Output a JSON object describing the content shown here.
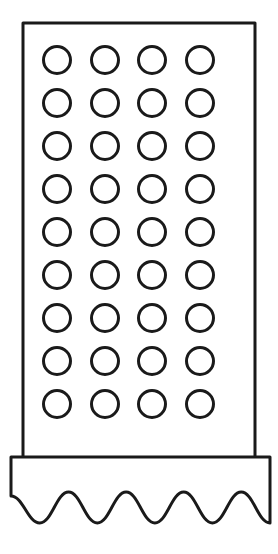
{
  "canvas": {
    "width": 278,
    "height": 554,
    "background_color": "#ffffff",
    "stroke_color": "#1a1a1a"
  },
  "figure": {
    "name": "box-grater-line-drawing",
    "style": "line-art",
    "fill_color": "#ffffff"
  },
  "body_panel": {
    "name": "perforated-body-panel",
    "x": 23,
    "y": 23,
    "width": 232,
    "height": 437,
    "stroke_width": 3,
    "fill_color": "#ffffff",
    "stroke_color": "#1a1a1a"
  },
  "hole_grid": {
    "name": "hole-grid",
    "columns": 4,
    "rows": 9,
    "total_holes": 36,
    "radius": 13.5,
    "stroke_width": 3,
    "column_centers_x": [
      57,
      105,
      152,
      200
    ],
    "row_centers_y": [
      60,
      103,
      146,
      189,
      232,
      275,
      318,
      361,
      404
    ],
    "fill_color": "#ffffff",
    "stroke_color": "#1a1a1a"
  },
  "base": {
    "name": "wavy-base",
    "x": 11,
    "y": 457,
    "width": 259,
    "top_edge_y": 457,
    "straight_side_bottom_y": 496,
    "wave": {
      "name": "wave-edge",
      "bumps": 4,
      "troughs": 5,
      "peak_y": 492,
      "trough_y": 523,
      "amplitude": 15.5,
      "period": 52
    },
    "stroke_width": 3,
    "fill_color": "#ffffff",
    "stroke_color": "#1a1a1a"
  }
}
